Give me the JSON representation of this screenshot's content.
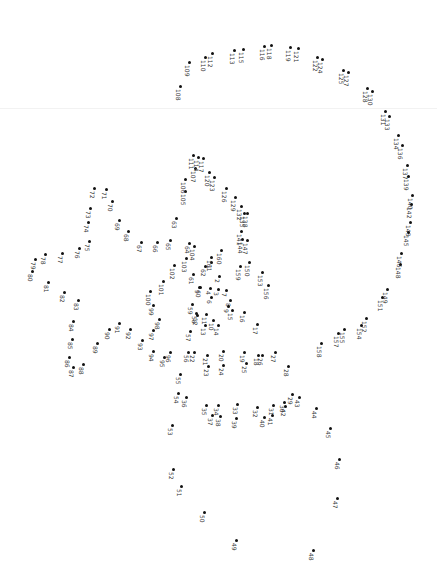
{
  "puzzle": {
    "type": "connect-the-dots",
    "orientation": "rotated-90",
    "dot_color": "#111111",
    "label_color": "#333333",
    "dots": [
      {
        "n": "1",
        "x": 211,
        "y": 262
      },
      {
        "n": "2",
        "x": 219,
        "y": 276
      },
      {
        "n": "3",
        "x": 218,
        "y": 289
      },
      {
        "n": "4",
        "x": 210,
        "y": 288
      },
      {
        "n": "5",
        "x": 199,
        "y": 287
      },
      {
        "n": "6",
        "x": 211,
        "y": 297
      },
      {
        "n": "7",
        "x": 226,
        "y": 290
      },
      {
        "n": "8",
        "x": 230,
        "y": 300
      },
      {
        "n": "9",
        "x": 228,
        "y": 306
      },
      {
        "n": "10",
        "x": 213,
        "y": 320
      },
      {
        "n": "11",
        "x": 206,
        "y": 314
      },
      {
        "n": "12",
        "x": 197,
        "y": 315
      },
      {
        "n": "13",
        "x": 205,
        "y": 325
      },
      {
        "n": "14",
        "x": 218,
        "y": 325
      },
      {
        "n": "15",
        "x": 232,
        "y": 310
      },
      {
        "n": "16",
        "x": 244,
        "y": 312
      },
      {
        "n": "17",
        "x": 257,
        "y": 324
      },
      {
        "n": "18",
        "x": 258,
        "y": 355
      },
      {
        "n": "19",
        "x": 244,
        "y": 352
      },
      {
        "n": "20",
        "x": 223,
        "y": 351
      },
      {
        "n": "21",
        "x": 207,
        "y": 355
      },
      {
        "n": "22",
        "x": 194,
        "y": 352
      },
      {
        "n": "23",
        "x": 208,
        "y": 366
      },
      {
        "n": "24",
        "x": 223,
        "y": 365
      },
      {
        "n": "25",
        "x": 246,
        "y": 363
      },
      {
        "n": "26",
        "x": 262,
        "y": 355
      },
      {
        "n": "27",
        "x": 275,
        "y": 352
      },
      {
        "n": "28",
        "x": 288,
        "y": 366
      },
      {
        "n": "29",
        "x": 292,
        "y": 394
      },
      {
        "n": "30",
        "x": 284,
        "y": 402
      },
      {
        "n": "31",
        "x": 273,
        "y": 405
      },
      {
        "n": "32",
        "x": 257,
        "y": 407
      },
      {
        "n": "33",
        "x": 237,
        "y": 404
      },
      {
        "n": "34",
        "x": 218,
        "y": 405
      },
      {
        "n": "35",
        "x": 206,
        "y": 405
      },
      {
        "n": "36",
        "x": 186,
        "y": 397
      },
      {
        "n": "37",
        "x": 212,
        "y": 415
      },
      {
        "n": "38",
        "x": 220,
        "y": 416
      },
      {
        "n": "39",
        "x": 236,
        "y": 418
      },
      {
        "n": "40",
        "x": 264,
        "y": 417
      },
      {
        "n": "41",
        "x": 272,
        "y": 415
      },
      {
        "n": "42",
        "x": 285,
        "y": 406
      },
      {
        "n": "43",
        "x": 299,
        "y": 397
      },
      {
        "n": "44",
        "x": 316,
        "y": 408
      },
      {
        "n": "45",
        "x": 330,
        "y": 428
      },
      {
        "n": "46",
        "x": 339,
        "y": 459
      },
      {
        "n": "47",
        "x": 337,
        "y": 498
      },
      {
        "n": "48",
        "x": 313,
        "y": 550
      },
      {
        "n": "49",
        "x": 236,
        "y": 540
      },
      {
        "n": "50",
        "x": 204,
        "y": 512
      },
      {
        "n": "51",
        "x": 181,
        "y": 486
      },
      {
        "n": "52",
        "x": 173,
        "y": 469
      },
      {
        "n": "53",
        "x": 172,
        "y": 425
      },
      {
        "n": "54",
        "x": 178,
        "y": 393
      },
      {
        "n": "55",
        "x": 180,
        "y": 374
      },
      {
        "n": "56",
        "x": 188,
        "y": 352
      },
      {
        "n": "57",
        "x": 190,
        "y": 331
      },
      {
        "n": "58",
        "x": 196,
        "y": 313
      },
      {
        "n": "59",
        "x": 192,
        "y": 304
      },
      {
        "n": "60",
        "x": 200,
        "y": 287
      },
      {
        "n": "61",
        "x": 193,
        "y": 274
      },
      {
        "n": "62",
        "x": 205,
        "y": 266
      },
      {
        "n": "63",
        "x": 176,
        "y": 218
      },
      {
        "n": "64",
        "x": 189,
        "y": 243
      },
      {
        "n": "65",
        "x": 170,
        "y": 240
      },
      {
        "n": "66",
        "x": 157,
        "y": 242
      },
      {
        "n": "67",
        "x": 141,
        "y": 242
      },
      {
        "n": "68",
        "x": 128,
        "y": 231
      },
      {
        "n": "69",
        "x": 119,
        "y": 220
      },
      {
        "n": "70",
        "x": 112,
        "y": 201
      },
      {
        "n": "71",
        "x": 106,
        "y": 189
      },
      {
        "n": "72",
        "x": 94,
        "y": 188
      },
      {
        "n": "73",
        "x": 90,
        "y": 208
      },
      {
        "n": "74",
        "x": 88,
        "y": 222
      },
      {
        "n": "75",
        "x": 89,
        "y": 241
      },
      {
        "n": "76",
        "x": 79,
        "y": 248
      },
      {
        "n": "77",
        "x": 62,
        "y": 253
      },
      {
        "n": "78",
        "x": 45,
        "y": 254
      },
      {
        "n": "79",
        "x": 35,
        "y": 259
      },
      {
        "n": "80",
        "x": 32,
        "y": 271
      },
      {
        "n": "81",
        "x": 48,
        "y": 282
      },
      {
        "n": "82",
        "x": 64,
        "y": 292
      },
      {
        "n": "83",
        "x": 78,
        "y": 300
      },
      {
        "n": "84",
        "x": 73,
        "y": 321
      },
      {
        "n": "85",
        "x": 72,
        "y": 339
      },
      {
        "n": "86",
        "x": 69,
        "y": 357
      },
      {
        "n": "87",
        "x": 73,
        "y": 367
      },
      {
        "n": "88",
        "x": 83,
        "y": 364
      },
      {
        "n": "89",
        "x": 97,
        "y": 343
      },
      {
        "n": "90",
        "x": 109,
        "y": 329
      },
      {
        "n": "91",
        "x": 119,
        "y": 323
      },
      {
        "n": "92",
        "x": 130,
        "y": 329
      },
      {
        "n": "93",
        "x": 142,
        "y": 340
      },
      {
        "n": "94",
        "x": 153,
        "y": 351
      },
      {
        "n": "95",
        "x": 164,
        "y": 357
      },
      {
        "n": "96",
        "x": 170,
        "y": 352
      },
      {
        "n": "97",
        "x": 153,
        "y": 330
      },
      {
        "n": "98",
        "x": 159,
        "y": 319
      },
      {
        "n": "99",
        "x": 153,
        "y": 305
      },
      {
        "n": "100",
        "x": 150,
        "y": 291
      },
      {
        "n": "101",
        "x": 163,
        "y": 281
      },
      {
        "n": "102",
        "x": 174,
        "y": 265
      },
      {
        "n": "103",
        "x": 186,
        "y": 258
      },
      {
        "n": "104",
        "x": 194,
        "y": 246
      },
      {
        "n": "105",
        "x": 185,
        "y": 191
      },
      {
        "n": "106",
        "x": 185,
        "y": 179
      },
      {
        "n": "107",
        "x": 195,
        "y": 168
      },
      {
        "n": "108",
        "x": 180,
        "y": 86
      },
      {
        "n": "109",
        "x": 189,
        "y": 62
      },
      {
        "n": "110",
        "x": 205,
        "y": 57
      },
      {
        "n": "111",
        "x": 193,
        "y": 155
      },
      {
        "n": "112",
        "x": 212,
        "y": 53
      },
      {
        "n": "113",
        "x": 234,
        "y": 50
      },
      {
        "n": "114",
        "x": 198,
        "y": 157
      },
      {
        "n": "115",
        "x": 243,
        "y": 49
      },
      {
        "n": "116",
        "x": 264,
        "y": 46
      },
      {
        "n": "117",
        "x": 203,
        "y": 158
      },
      {
        "n": "118",
        "x": 271,
        "y": 45
      },
      {
        "n": "119",
        "x": 290,
        "y": 47
      },
      {
        "n": "120",
        "x": 209,
        "y": 172
      },
      {
        "n": "121",
        "x": 298,
        "y": 48
      },
      {
        "n": "122",
        "x": 317,
        "y": 57
      },
      {
        "n": "123",
        "x": 214,
        "y": 177
      },
      {
        "n": "124",
        "x": 322,
        "y": 59
      },
      {
        "n": "125",
        "x": 343,
        "y": 70
      },
      {
        "n": "126",
        "x": 226,
        "y": 188
      },
      {
        "n": "127",
        "x": 348,
        "y": 72
      },
      {
        "n": "128",
        "x": 367,
        "y": 88
      },
      {
        "n": "129",
        "x": 235,
        "y": 197
      },
      {
        "n": "130",
        "x": 372,
        "y": 91
      },
      {
        "n": "131",
        "x": 385,
        "y": 111
      },
      {
        "n": "132",
        "x": 241,
        "y": 206
      },
      {
        "n": "133",
        "x": 389,
        "y": 116
      },
      {
        "n": "134",
        "x": 398,
        "y": 135
      },
      {
        "n": "135",
        "x": 244,
        "y": 213
      },
      {
        "n": "136",
        "x": 402,
        "y": 145
      },
      {
        "n": "137",
        "x": 407,
        "y": 165
      },
      {
        "n": "138",
        "x": 247,
        "y": 213
      },
      {
        "n": "139",
        "x": 408,
        "y": 176
      },
      {
        "n": "140",
        "x": 412,
        "y": 195
      },
      {
        "n": "141",
        "x": 241,
        "y": 231
      },
      {
        "n": "142",
        "x": 411,
        "y": 204
      },
      {
        "n": "143",
        "x": 410,
        "y": 222
      },
      {
        "n": "144",
        "x": 242,
        "y": 239
      },
      {
        "n": "145",
        "x": 408,
        "y": 232
      },
      {
        "n": "146",
        "x": 401,
        "y": 253
      },
      {
        "n": "147",
        "x": 247,
        "y": 240
      },
      {
        "n": "148",
        "x": 400,
        "y": 264
      },
      {
        "n": "149",
        "x": 387,
        "y": 289
      },
      {
        "n": "150",
        "x": 249,
        "y": 262
      },
      {
        "n": "151",
        "x": 382,
        "y": 297
      },
      {
        "n": "152",
        "x": 366,
        "y": 318
      },
      {
        "n": "153",
        "x": 262,
        "y": 272
      },
      {
        "n": "154",
        "x": 361,
        "y": 325
      },
      {
        "n": "155",
        "x": 344,
        "y": 329
      },
      {
        "n": "156",
        "x": 268,
        "y": 285
      },
      {
        "n": "157",
        "x": 338,
        "y": 333
      },
      {
        "n": "158",
        "x": 321,
        "y": 343
      },
      {
        "n": "159",
        "x": 240,
        "y": 266
      },
      {
        "n": "160",
        "x": 221,
        "y": 250
      },
      {
        "n": "161",
        "x": 211,
        "y": 257
      }
    ]
  }
}
